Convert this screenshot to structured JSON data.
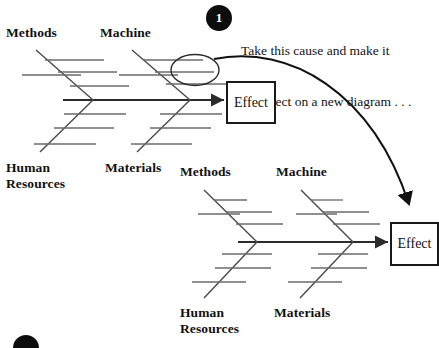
{
  "canvas": {
    "width": 439,
    "height": 348,
    "background": "#ffffff"
  },
  "stroke_color": "#2b2b2b",
  "bone_color": "#555555",
  "ink_color": "#111111",
  "callout": {
    "badge_number": "1",
    "badge_color": "#0d0d0d",
    "badge_text_color": "#ffffff",
    "line1": "Take this cause and make it",
    "line2": "the effect on a new diagram . . ."
  },
  "diagram_top": {
    "effect_label": "Effect",
    "categories": [
      {
        "label": "Methods",
        "position": "top-left"
      },
      {
        "label": "Machine",
        "position": "top-right"
      },
      {
        "label": "Human\nResources",
        "position": "bottom-left"
      },
      {
        "label": "Materials",
        "position": "bottom-right"
      }
    ],
    "highlight": {
      "shape": "ellipse",
      "target": "machine-sub-cause"
    }
  },
  "diagram_bottom": {
    "effect_label": "Effect",
    "categories": [
      {
        "label": "Methods",
        "position": "top-left"
      },
      {
        "label": "Machine",
        "position": "top-right"
      },
      {
        "label": "Human\nResources",
        "position": "bottom-left"
      },
      {
        "label": "Materials",
        "position": "bottom-right"
      }
    ]
  },
  "badge_partial": {
    "number": "2",
    "clipped": true
  }
}
